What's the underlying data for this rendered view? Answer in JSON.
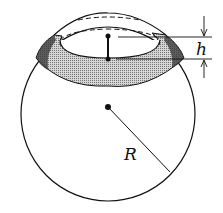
{
  "diagram": {
    "labels": {
      "height": "h",
      "radius": "R"
    },
    "colors": {
      "stroke": "#111111",
      "band_fill": "#bdbdbd",
      "background": "#ffffff"
    }
  }
}
